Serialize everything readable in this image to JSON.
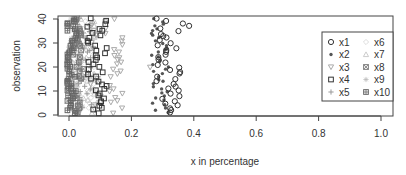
{
  "chart_data": {
    "type": "scatter",
    "title": "",
    "xlabel": "x in percentage",
    "ylabel": "observation",
    "xlim": [
      -0.04,
      1.04
    ],
    "ylim": [
      -0.5,
      40.5
    ],
    "x_ticks": [
      0.0,
      0.2,
      0.4,
      0.6,
      0.8,
      1.0
    ],
    "x_tick_labels": [
      "0.0",
      "0.2",
      "0.4",
      "0.6",
      "0.8",
      "1.0"
    ],
    "y_ticks": [
      0,
      10,
      20,
      30,
      40
    ],
    "y_tick_labels": [
      "0",
      "10",
      "20",
      "30",
      "40"
    ],
    "grid": false,
    "legend_position": "right-center (inside plot)",
    "legend": [
      {
        "name": "x1",
        "marker": "open-circle",
        "color": "#333333"
      },
      {
        "name": "x2",
        "marker": "filled-circle-small",
        "color": "#555555"
      },
      {
        "name": "x3",
        "marker": "open-triangle-down",
        "color": "#aaaaaa"
      },
      {
        "name": "x4",
        "marker": "open-square",
        "color": "#333333"
      },
      {
        "name": "x5",
        "marker": "plus",
        "color": "#999999"
      },
      {
        "name": "x6",
        "marker": "open-diamond",
        "color": "#dddddd"
      },
      {
        "name": "x7",
        "marker": "open-triangle-up",
        "color": "#cccccc"
      },
      {
        "name": "x8",
        "marker": "crossed-square",
        "color": "#777777"
      },
      {
        "name": "x9",
        "marker": "asterisk",
        "color": "#bbbbbb"
      },
      {
        "name": "x10",
        "marker": "plus-square",
        "color": "#666666"
      }
    ],
    "series": [
      {
        "name": "x1",
        "x_range": [
          0.27,
          0.39
        ],
        "y": "1..40",
        "note": "open circles clustered around 0.30-0.36, a few near 0.37-0.39 at top"
      },
      {
        "name": "x2",
        "x_range": [
          0.26,
          0.33
        ],
        "y": "1..40",
        "note": "small filled dots around 0.27-0.32"
      },
      {
        "name": "x3",
        "x_range": [
          0.05,
          0.26
        ],
        "y": "1..40",
        "note": "triangles spread 0.08-0.19, outlier ~0.26 at y=20"
      },
      {
        "name": "x4",
        "x_range": [
          0.06,
          0.14
        ],
        "y": "1..40",
        "note": "open squares around 0.08-0.12"
      },
      {
        "name": "x5",
        "x_range": [
          0.02,
          0.08
        ],
        "y": "1..40"
      },
      {
        "name": "x6",
        "x_range": [
          0.02,
          0.08
        ],
        "y": "1..40"
      },
      {
        "name": "x7",
        "x_range": [
          0.02,
          0.08
        ],
        "y": "1..40"
      },
      {
        "name": "x8",
        "x_range": [
          0.0,
          0.06
        ],
        "y": "1..40"
      },
      {
        "name": "x9",
        "x_range": [
          0.0,
          0.05
        ],
        "y": "1..40"
      },
      {
        "name": "x10",
        "x_range": [
          0.0,
          0.03
        ],
        "y": "1..40",
        "note": "dense column near 0.0-0.02"
      }
    ]
  }
}
